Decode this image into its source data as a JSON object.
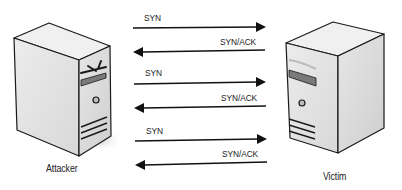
{
  "diagram": {
    "type": "SYN flood sequence",
    "nodes": {
      "attacker": {
        "label": "Attacker",
        "icon": "server-tower-icon"
      },
      "victim": {
        "label": "Victim",
        "icon": "server-tower-icon"
      }
    },
    "messages": [
      {
        "label": "SYN",
        "direction": "attacker-to-victim"
      },
      {
        "label": "SYN/ACK",
        "direction": "victim-to-attacker"
      },
      {
        "label": "SYN",
        "direction": "attacker-to-victim"
      },
      {
        "label": "SYN/ACK",
        "direction": "victim-to-attacker"
      },
      {
        "label": "SYN",
        "direction": "attacker-to-victim"
      },
      {
        "label": "SYN/ACK",
        "direction": "victim-to-attacker"
      }
    ],
    "colors": {
      "background": "#ffffff",
      "outline": "#1a1a1a",
      "server_front": "#e4e4e4",
      "server_side": "#d2d2d2",
      "server_top": "#efefef",
      "shadow": "#d9d9d9"
    }
  }
}
